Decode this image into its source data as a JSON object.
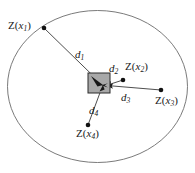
{
  "figure": {
    "background_color": "#ffffff",
    "boundary": {
      "shape": "ellipse",
      "cx": 97.5,
      "cy": 86.5,
      "rx": 90,
      "ry": 76,
      "stroke_color": "#6b6b6b",
      "stroke_width": 0.9,
      "fill": "none"
    },
    "cell": {
      "name": "interpolation-cell",
      "x": 88,
      "y": 73,
      "width": 22,
      "height": 20,
      "fill_color": "#a8a8a8",
      "stroke_color": "#2b2b2b",
      "stroke_width": 1.0
    },
    "target_point": {
      "x": 103,
      "y": 85
    },
    "sample_points": [
      {
        "id": "z1",
        "label_prefix": "Z(",
        "label_var": "x",
        "label_sub": "1",
        "label_suffix": ")",
        "label_text": "Z(x1)",
        "dot_x": 44,
        "dot_y": 28,
        "dot_r": 2.3,
        "dot_color": "#111111",
        "distance": {
          "id": "d1",
          "label_var": "d",
          "label_sub": "1",
          "label_text": "d1",
          "stroke_color": "#3a3a3a",
          "stroke_width": 0.9,
          "arrow": true
        }
      },
      {
        "id": "z2",
        "label_prefix": "Z(",
        "label_var": "x",
        "label_sub": "2",
        "label_suffix": ")",
        "label_text": "Z(x2)",
        "dot_x": 123,
        "dot_y": 80,
        "dot_r": 2.3,
        "dot_color": "#111111",
        "distance": {
          "id": "d2",
          "label_var": "d",
          "label_sub": "2",
          "label_text": "d2",
          "stroke_color": "#3a3a3a",
          "stroke_width": 0.9,
          "arrow": true
        }
      },
      {
        "id": "z3",
        "label_prefix": "Z(",
        "label_var": "x",
        "label_sub": "3",
        "label_suffix": ")",
        "label_text": "Z(x3)",
        "dot_x": 161,
        "dot_y": 90,
        "dot_r": 2.3,
        "dot_color": "#111111",
        "distance": {
          "id": "d3",
          "label_var": "d",
          "label_sub": "3",
          "label_text": "d3",
          "stroke_color": "#3a3a3a",
          "stroke_width": 0.9,
          "arrow": true
        }
      },
      {
        "id": "z4",
        "label_prefix": "Z(",
        "label_var": "x",
        "label_sub": "4",
        "label_suffix": ")",
        "label_text": "Z(x4)",
        "dot_x": 88,
        "dot_y": 125,
        "dot_r": 2.3,
        "dot_color": "#111111",
        "distance": {
          "id": "d4",
          "label_var": "d",
          "label_sub": "4",
          "label_text": "d4",
          "stroke_color": "#3a3a3a",
          "stroke_width": 0.9,
          "arrow": false
        }
      }
    ]
  }
}
